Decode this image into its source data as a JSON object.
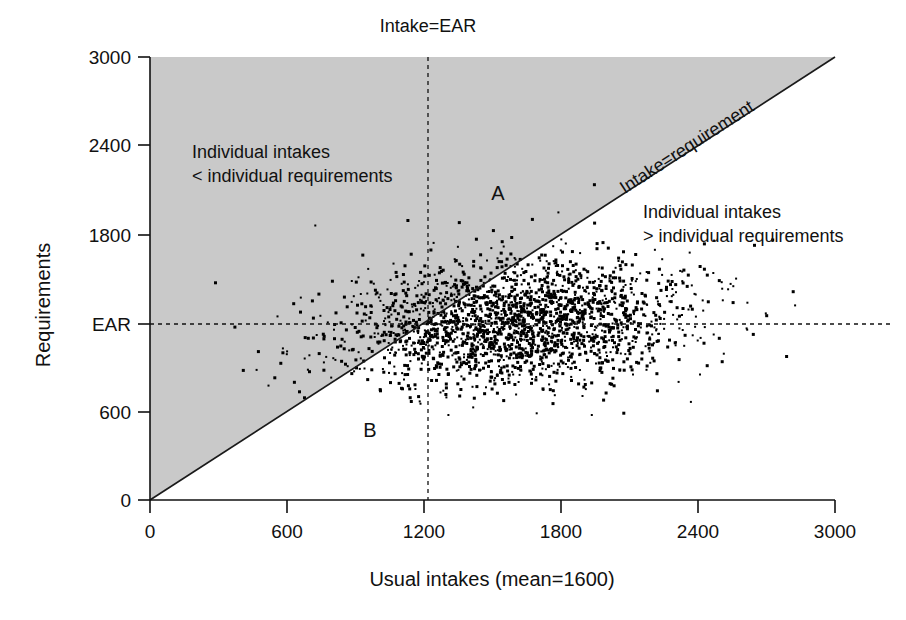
{
  "figure": {
    "background_color": "#ffffff",
    "shade_color": "#c9c9c9",
    "ink_color": "#111111"
  },
  "axes": {
    "x_title": "Usual intakes (mean=1600)",
    "y_title": "Requirements",
    "x_ticks": [
      "0",
      "600",
      "1200",
      "1800",
      "2400",
      "3000"
    ],
    "y_ticks": [
      "0",
      "600",
      "EAR",
      "1800",
      "2400",
      "3000"
    ]
  },
  "annotations": {
    "top_label": "Intake=EAR",
    "diagonal_label": "Intake=requirement",
    "upper_left_line1": "Individual intakes",
    "upper_left_line2": "< individual requirements",
    "lower_right_line1": "Individual intakes",
    "lower_right_line2": "> individual requirements",
    "region_a": "A",
    "region_b": "B"
  },
  "chart_data": {
    "type": "scatter",
    "title": "",
    "xlabel": "Usual intakes (mean=1600)",
    "ylabel": "Requirements",
    "xlim": [
      0,
      3000
    ],
    "ylim": [
      0,
      3000
    ],
    "xticks": [
      0,
      600,
      1200,
      1800,
      2400,
      3000
    ],
    "yticks": [
      0,
      600,
      1200,
      1800,
      2400,
      3000
    ],
    "ytick_labels": [
      "0",
      "600",
      "EAR",
      "1800",
      "2400",
      "3000"
    ],
    "grid": false,
    "legend": "none",
    "n_points": 2200,
    "point_color": "#000000",
    "point_size_px": 3,
    "marker": "square",
    "distribution": {
      "x_mean": 1600,
      "x_sd": 380,
      "y_mean": 1200,
      "y_sd": 215,
      "x_y_correlation": 0.13,
      "x_clip": [
        150,
        2980
      ],
      "y_clip": [
        560,
        2150
      ]
    },
    "reference_lines": [
      {
        "name": "Intake=EAR",
        "type": "vertical",
        "value": 1200,
        "style": "dashed"
      },
      {
        "name": "EAR",
        "type": "horizontal",
        "value": 1200,
        "style": "dashed"
      },
      {
        "name": "Intake=requirement",
        "type": "identity",
        "slope": 1,
        "intercept": 0,
        "style": "solid"
      }
    ],
    "shaded_region": {
      "name": "intake-less-than-requirement",
      "description": "Area above the identity line (requirements > intakes)",
      "color": "#c9c9c9"
    },
    "region_markers": [
      {
        "label": "A",
        "x": 1570,
        "y": 2060,
        "meaning": "intake below requirement but intake above EAR"
      },
      {
        "label": "B",
        "x": 1000,
        "y": 480,
        "meaning": "intake above requirement but intake below EAR"
      }
    ]
  }
}
